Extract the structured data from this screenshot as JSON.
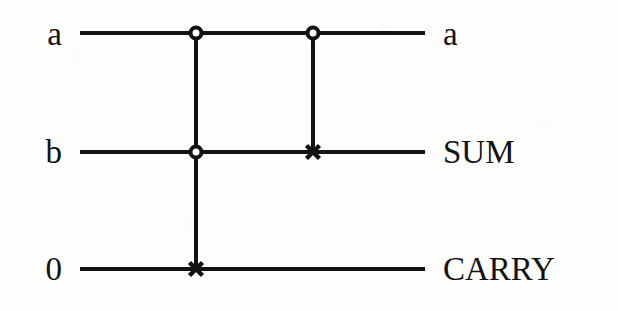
{
  "figure": {
    "kind": "quantum-circuit-diagram",
    "name": "one-bit full adder circuit",
    "background_color": "#fdfdfc",
    "ink_color": "#121212",
    "wire_thickness": 4
  },
  "wires": [
    {
      "id": "wire-a",
      "input_label": "a",
      "output_label": "a",
      "y": 33,
      "x_start": 80,
      "x_end": 425
    },
    {
      "id": "wire-b",
      "input_label": "b",
      "output_label": "SUM",
      "y": 152,
      "x_start": 80,
      "x_end": 425
    },
    {
      "id": "wire-ancilla",
      "input_label": "0",
      "output_label": "CARRY",
      "y": 269,
      "x_start": 80,
      "x_end": 425
    }
  ],
  "gates": [
    {
      "id": "gate-toffoli",
      "type": "toffoli",
      "label": "CCNOT",
      "x": 196,
      "controls": [
        {
          "wire": "wire-a",
          "y": 33,
          "symbol": "open-circle",
          "radius": 7
        },
        {
          "wire": "wire-b",
          "y": 152,
          "symbol": "open-circle",
          "radius": 7
        }
      ],
      "target": {
        "wire": "wire-ancilla",
        "y": 269,
        "symbol": "x-cross",
        "size": 13
      },
      "connector": {
        "y_top": 33,
        "y_bottom": 269
      }
    },
    {
      "id": "gate-cnot",
      "type": "cnot",
      "label": "CNOT",
      "x": 313,
      "controls": [
        {
          "wire": "wire-a",
          "y": 33,
          "symbol": "open-circle",
          "radius": 7
        }
      ],
      "target": {
        "wire": "wire-b",
        "y": 152,
        "symbol": "x-cross",
        "size": 13
      },
      "connector": {
        "y_top": 33,
        "y_bottom": 152
      }
    }
  ],
  "label_positions": {
    "left_x_right_edge": 62,
    "right_x_left_edge": 443
  }
}
